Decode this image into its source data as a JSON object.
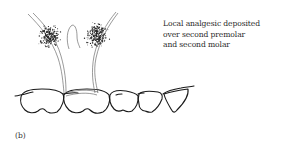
{
  "figure": {
    "panel_label": "(b)",
    "annotation_lines": [
      "Local analgesic deposited",
      "over second premolar",
      "and second molar"
    ],
    "injection_sites": [
      {
        "name": "site-second-premolar"
      },
      {
        "name": "site-second-molar"
      }
    ],
    "teeth": [
      {
        "name": "molar-1"
      },
      {
        "name": "molar-2"
      },
      {
        "name": "premolar-2"
      },
      {
        "name": "premolar-1"
      },
      {
        "name": "canine"
      }
    ]
  }
}
